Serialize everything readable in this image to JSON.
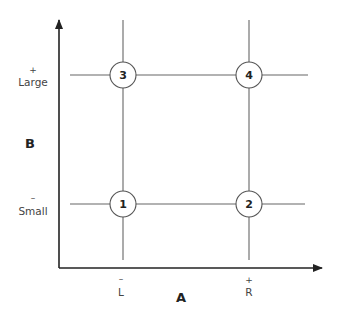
{
  "diagram": {
    "type": "2x2 factorial design",
    "y_axis": {
      "name": "B",
      "levels": [
        {
          "sign": "+",
          "label": "Large"
        },
        {
          "sign": "–",
          "label": "Small"
        }
      ]
    },
    "x_axis": {
      "name": "A",
      "levels": [
        {
          "sign": "–",
          "label": "L"
        },
        {
          "sign": "+",
          "label": "R"
        }
      ]
    },
    "cells": [
      {
        "id": "1",
        "a": "L",
        "b": "Small"
      },
      {
        "id": "2",
        "a": "R",
        "b": "Small"
      },
      {
        "id": "3",
        "a": "L",
        "b": "Large"
      },
      {
        "id": "4",
        "a": "R",
        "b": "Large"
      }
    ],
    "colors": {
      "axis": "#222222",
      "gridline": "#666666",
      "text": "#444444"
    }
  }
}
